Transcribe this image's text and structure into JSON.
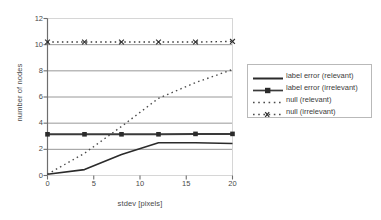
{
  "chart_data": {
    "type": "line",
    "title": "",
    "xlabel": "stdev [pixels]",
    "ylabel": "number of nodes",
    "xlim": [
      0,
      20
    ],
    "ylim": [
      0,
      12
    ],
    "xticks": [
      "0",
      "5",
      "10",
      "15",
      "20"
    ],
    "xtick_values": [
      0,
      5,
      10,
      15,
      20
    ],
    "yticks": [
      "0",
      "2",
      "4",
      "6",
      "8",
      "10",
      "12"
    ],
    "ytick_values": [
      0,
      2,
      4,
      6,
      8,
      10,
      12
    ],
    "grid": "horizontal",
    "legend_position": "right-outside",
    "x": [
      0,
      4,
      8,
      12,
      16,
      20
    ],
    "series": [
      {
        "name": "label error (relevant)",
        "style": "solid",
        "marker": "none",
        "width": 1.6,
        "color": "#2b2b2b",
        "values": [
          0.1,
          0.45,
          1.6,
          2.5,
          2.5,
          2.45
        ]
      },
      {
        "name": "label error (irrelevant)",
        "style": "solid",
        "marker": "square",
        "width": 2.0,
        "color": "#3a3a3a",
        "values": [
          3.15,
          3.15,
          3.15,
          3.15,
          3.18,
          3.18
        ]
      },
      {
        "name": "null  (relevant)",
        "style": "dotted",
        "marker": "none",
        "width": 1.4,
        "color": "#4a4a4a",
        "values": [
          0.1,
          1.7,
          3.75,
          5.9,
          7.1,
          8.1
        ]
      },
      {
        "name": "null (irrelevant)",
        "style": "dotted",
        "marker": "cross",
        "width": 1.4,
        "color": "#3a3a3a",
        "values": [
          10.2,
          10.2,
          10.2,
          10.2,
          10.2,
          10.25
        ]
      }
    ]
  },
  "legend": {
    "entries": [
      {
        "label": "label error (relevant)"
      },
      {
        "label": "label error (irrelevant)"
      },
      {
        "label": "null  (relevant)"
      },
      {
        "label": "null (irrelevant)"
      }
    ]
  },
  "colors": {
    "axis": "#6e6e6e",
    "grid": "#8c8c8c",
    "plot_border": "#d6d6d6",
    "text": "#3c3c3c",
    "background": "#ffffff"
  }
}
